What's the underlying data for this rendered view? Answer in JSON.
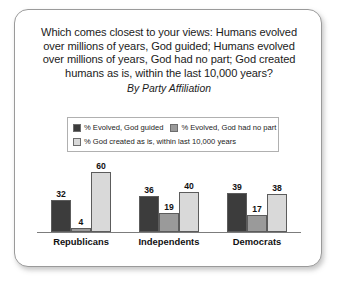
{
  "card": {
    "title_lines": [
      "Which comes closest to your views: Humans evolved",
      "over millions of years, God guided; Humans evolved",
      "over millions of years, God had no part; God created",
      "humans as is, within the last 10,000 years?"
    ],
    "subtitle": "By Party Affiliation"
  },
  "chart_data": {
    "type": "bar",
    "subtitle": "By Party Affiliation",
    "categories": [
      "Republicans",
      "Independents",
      "Democrats"
    ],
    "series": [
      {
        "name": "% Evolved, God guided",
        "color": "#3c3c3c",
        "values": [
          32,
          36,
          39
        ]
      },
      {
        "name": "% Evolved, God had no part",
        "color": "#9a9a9a",
        "values": [
          4,
          19,
          17
        ]
      },
      {
        "name": "% God created as is, within last 10,000 years",
        "color": "#d9d9d9",
        "values": [
          60,
          40,
          38
        ]
      }
    ],
    "xlabel": "",
    "ylabel": "",
    "ylim": [
      0,
      62
    ],
    "grid": false,
    "legend_position": "top",
    "value_labels": true
  }
}
